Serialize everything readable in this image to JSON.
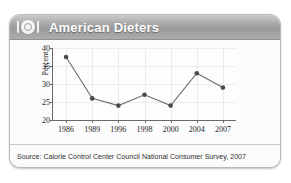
{
  "card": {
    "header": {
      "title": "American Dieters",
      "icon": "dining-plate-icon",
      "bar_color": "#a5a5a5",
      "title_color": "#ffffff"
    },
    "footer": {
      "source": "Source: Calorie Control Center Council National Consumer Survey, 2007"
    }
  },
  "chart_data": {
    "type": "line",
    "title": "American Dieters",
    "xlabel": "",
    "ylabel": "Percent",
    "categories": [
      "1986",
      "1989",
      "1996",
      "1998",
      "2000",
      "2004",
      "2007"
    ],
    "values": [
      37.5,
      26.0,
      24.0,
      27.0,
      24.0,
      33.0,
      29.0
    ],
    "series": [
      {
        "name": "Percent of American dieters",
        "values": [
          37.5,
          26.0,
          24.0,
          27.0,
          24.0,
          33.0,
          29.0
        ]
      }
    ],
    "ylim": [
      20,
      40
    ],
    "yticks": [
      20,
      25,
      30,
      35,
      40
    ],
    "ytick_labels": [
      "20",
      "25",
      "30",
      "35",
      "40"
    ],
    "xtick_labels": [
      "1986",
      "1989",
      "1996",
      "1998",
      "2000",
      "2004",
      "2007"
    ],
    "grid": true,
    "legend": "none",
    "marker": "circle",
    "line_color": "#6e6e6e",
    "marker_color": "#4a4a4a",
    "annotations": []
  }
}
